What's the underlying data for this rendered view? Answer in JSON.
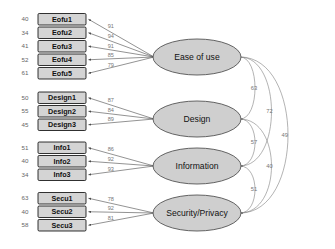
{
  "chart_data": {
    "type": "diagram",
    "diagram_kind": "cfa-path-diagram",
    "title": "",
    "factors": [
      {
        "id": "ease_of_use",
        "label": "Ease of use",
        "indicators": [
          {
            "label": "Eofu1",
            "loading": "91",
            "error": "40"
          },
          {
            "label": "Eofu2",
            "loading": "94",
            "error": "34"
          },
          {
            "label": "Eofu3",
            "loading": "91",
            "error": "41"
          },
          {
            "label": "Eofu4",
            "loading": "85",
            "error": "52"
          },
          {
            "label": "Eofu5",
            "loading": "79",
            "error": "61"
          }
        ]
      },
      {
        "id": "design",
        "label": "Design",
        "indicators": [
          {
            "label": "Design1",
            "loading": "87",
            "error": "50"
          },
          {
            "label": "Design2",
            "loading": "84",
            "error": "55"
          },
          {
            "label": "Design3",
            "loading": "89",
            "error": "45"
          }
        ]
      },
      {
        "id": "information",
        "label": "Information",
        "indicators": [
          {
            "label": "Info1",
            "loading": "86",
            "error": "51"
          },
          {
            "label": "Info2",
            "loading": "92",
            "error": "40"
          },
          {
            "label": "Info3",
            "loading": "93",
            "error": "34"
          }
        ]
      },
      {
        "id": "security_privacy",
        "label": "Security/Privacy",
        "indicators": [
          {
            "label": "Secu1",
            "loading": "78",
            "error": "63"
          },
          {
            "label": "Secu2",
            "loading": "92",
            "error": "40"
          },
          {
            "label": "Secu3",
            "loading": "81",
            "error": "58"
          }
        ]
      }
    ],
    "correlations": [
      {
        "from": "ease_of_use",
        "to": "design",
        "value": "63"
      },
      {
        "from": "design",
        "to": "information",
        "value": "57"
      },
      {
        "from": "information",
        "to": "security_privacy",
        "value": "51"
      },
      {
        "from": "ease_of_use",
        "to": "information",
        "value": "72"
      },
      {
        "from": "design",
        "to": "security_privacy",
        "value": "40"
      },
      {
        "from": "ease_of_use",
        "to": "security_privacy",
        "value": "49"
      }
    ],
    "colors": {
      "box_fill": "#d4d4d4",
      "ellipse_fill": "#cfcfcf",
      "stroke": "#4a4a4a",
      "background": "#ffffff"
    }
  }
}
